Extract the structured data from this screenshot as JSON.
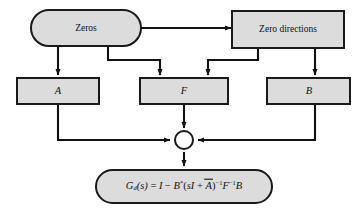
{
  "diagram": {
    "type": "block-diagram",
    "background_color": "#ffffff",
    "node_fill_color": "#dcdcdc",
    "node_stroke_color": "#1a1a1a",
    "connector_color": "#111111",
    "nodes": {
      "zeros": {
        "label": "Zeros",
        "shape": "stadium"
      },
      "zero_directions": {
        "label": "Zero directions",
        "shape": "rectangle"
      },
      "a": {
        "label": "A",
        "shape": "rectangle"
      },
      "f": {
        "label": "F",
        "shape": "rectangle"
      },
      "b": {
        "label": "B",
        "shape": "rectangle"
      },
      "junction": {
        "label": "",
        "shape": "circle"
      },
      "result": {
        "shape": "stadium",
        "formula_plain": "G_d(s) = I - B*(sI + A̅)^-1 F^-1 B",
        "parts": {
          "g": "G",
          "g_sub": "d",
          "of_s": "(s)",
          "equals": " = ",
          "identity": "I",
          "minus": " − ",
          "b_star": "B",
          "star": "*",
          "open_paren": "(",
          "sI": "sI",
          "plus": " + ",
          "a_bar": "A",
          "close_paren": ")",
          "inverse1": "−1",
          "f": "F",
          "inverse2": "−1",
          "b_end": "B"
        }
      }
    },
    "edges": [
      {
        "from": "zeros",
        "to": "zero_directions",
        "style": "horizontal-arrow"
      },
      {
        "from": "zeros",
        "to": "a",
        "style": "straight-down-arrow"
      },
      {
        "from": "zeros",
        "to": "f",
        "style": "elbow-right-down-arrow"
      },
      {
        "from": "zero_directions",
        "to": "f",
        "style": "elbow-left-down-arrow"
      },
      {
        "from": "zero_directions",
        "to": "b",
        "style": "straight-down-arrow"
      },
      {
        "from": "a",
        "to": "junction",
        "style": "elbow-down-right-arrow"
      },
      {
        "from": "f",
        "to": "junction",
        "style": "straight-down-arrow"
      },
      {
        "from": "b",
        "to": "junction",
        "style": "elbow-down-left-arrow"
      },
      {
        "from": "junction",
        "to": "result",
        "style": "straight-down-arrow"
      }
    ]
  }
}
